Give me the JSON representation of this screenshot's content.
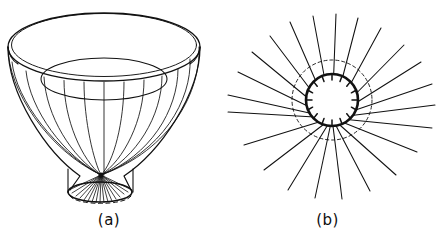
{
  "figure": {
    "background_color": "#ffffff",
    "ink_color": "#111111",
    "panels": [
      {
        "id": "a",
        "caption": "(a)",
        "subject": "three-dimensional embedding-diagram funnel / horn surface",
        "description": "Flared funnel seen in oblique perspective: wide elliptical top rim drawn with a double line for thickness, a second inner ellipse below it, curved meridian lines sweeping down and inward to a dark convergence point, then flaring out to a short cylindrical neck closed by a small ellipse whose lower arc is dashed.",
        "elements": {
          "top_rim_ellipse": {
            "center_x": 104,
            "center_y": 47,
            "radius_x": 96,
            "radius_y": 34
          },
          "rim_thickness_px": 4,
          "inner_throat_ellipse": {
            "center_x": 104,
            "center_y": 79,
            "radius_x": 63,
            "radius_y": 21
          },
          "meridian_count": 13,
          "convergence_point": {
            "x": 101,
            "y": 175
          },
          "neck_ellipse": {
            "center_x": 100,
            "center_y": 192,
            "radius_x": 32,
            "radius_y": 10
          },
          "neck_lower_arc_style": "dashed",
          "neck_fan_line_count": 17
        }
      },
      {
        "id": "b",
        "caption": "(b)",
        "subject": "plan view of the same surface looking down the funnel axis",
        "description": "Top-down view: a heavy solid inner circle ringed on its inside by short radial tick marks, a thin dashed outer circle, and a starburst of straight radial lines running outward to the edges of the panel; the rays are foreshortened so they appear to emanate from a point slightly below the circle centre.",
        "elements": {
          "inner_circle": {
            "center_x": 114,
            "center_y": 100,
            "radius": 26,
            "stroke_width": 2.6,
            "style": "solid"
          },
          "outer_circle": {
            "center_x": 114,
            "center_y": 100,
            "radius": 40,
            "stroke_width": 0.9,
            "style": "dashed"
          },
          "tick_mark_count": 16,
          "tick_mark_length_px": 6,
          "radial_ray_count": 22,
          "ray_origin": {
            "x": 114,
            "y": 118
          }
        }
      }
    ]
  }
}
